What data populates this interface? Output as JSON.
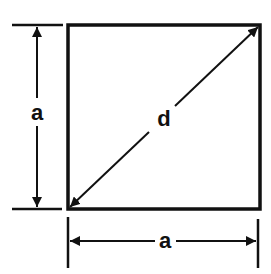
{
  "diagram": {
    "labels": {
      "side_vertical": "a",
      "side_horizontal": "a",
      "diagonal": "d"
    },
    "colors": {
      "line": "#111111",
      "background": "#ffffff"
    }
  }
}
